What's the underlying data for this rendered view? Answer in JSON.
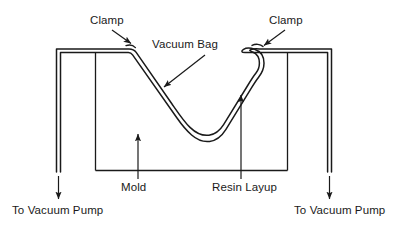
{
  "diagram": {
    "type": "technical-cross-section",
    "colors": {
      "background": "#ffffff",
      "line": "#1a1a1a",
      "text": "#1a1a1a"
    },
    "labels": {
      "clamp_left": "Clamp",
      "clamp_right": "Clamp",
      "vacuum_bag": "Vacuum Bag",
      "mold": "Mold",
      "resin_layup": "Resin Layup",
      "pump_left": "To Vacuum Pump",
      "pump_right": "To Vacuum Pump"
    },
    "components": [
      {
        "name": "mold",
        "shape": "open-box",
        "description": "Rectangular mold body with U-shaped cavity"
      },
      {
        "name": "vacuum-bag",
        "shape": "double-line-membrane",
        "description": "Flexible bag draped over the mold cavity"
      },
      {
        "name": "resin-layup",
        "shape": "layer",
        "description": "Resin layup conforming to cavity"
      },
      {
        "name": "clamp-left",
        "shape": "hook",
        "description": "Clamp securing bag at left rim"
      },
      {
        "name": "clamp-right",
        "shape": "hook",
        "description": "Clamp securing bag at right rim"
      }
    ],
    "leaders": [
      {
        "name": "clamp-left-leader",
        "from": [
          112,
          29
        ],
        "to": [
          132,
          44
        ]
      },
      {
        "name": "clamp-right-leader",
        "from": [
          284,
          29
        ],
        "to": [
          263,
          46
        ]
      },
      {
        "name": "vacuum-bag-leader",
        "from": [
          204,
          55
        ],
        "to": [
          163,
          88
        ]
      },
      {
        "name": "mold-arrow",
        "from": [
          138,
          179
        ],
        "to": [
          138,
          135
        ]
      },
      {
        "name": "resin-layup-arrow",
        "from": [
          241,
          179
        ],
        "to": [
          241,
          96
        ]
      },
      {
        "name": "pump-left-arrow",
        "from": [
          58,
          176
        ],
        "to": [
          58,
          199
        ]
      },
      {
        "name": "pump-right-arrow",
        "from": [
          330,
          176
        ],
        "to": [
          330,
          199
        ]
      }
    ]
  }
}
